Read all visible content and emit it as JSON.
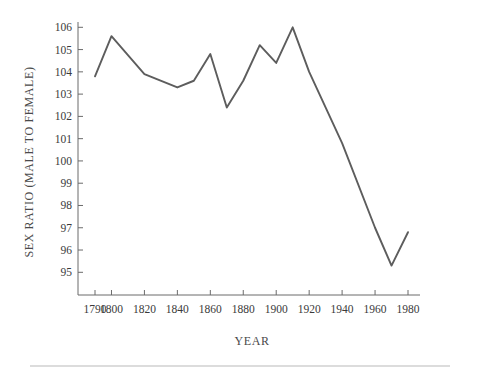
{
  "chart_data": {
    "type": "line",
    "title": "",
    "xlabel": "YEAR",
    "ylabel": "SEX RATIO (MALE TO FEMALE)",
    "xlim": [
      1785,
      1985
    ],
    "ylim": [
      94.4,
      106.4
    ],
    "grid": false,
    "legend": "none",
    "line_color": "#5d5d5d",
    "axis_color": "#6b6b6b",
    "text_color": "#3a3a3a",
    "xticks": [
      1790,
      1800,
      1820,
      1840,
      1860,
      1880,
      1900,
      1920,
      1940,
      1960,
      1980
    ],
    "xtick_labels": [
      "1790",
      "1800",
      "1820",
      "1840",
      "1860",
      "1880",
      "1900",
      "1920",
      "1940",
      "1960",
      "1980"
    ],
    "yticks": [
      95,
      96,
      97,
      98,
      99,
      100,
      101,
      102,
      103,
      104,
      105,
      106
    ],
    "ytick_labels": [
      "95",
      "96",
      "97",
      "98",
      "99",
      "100",
      "101",
      "102",
      "103",
      "104",
      "105",
      "106"
    ],
    "x": [
      1790,
      1800,
      1820,
      1840,
      1850,
      1860,
      1870,
      1880,
      1890,
      1900,
      1910,
      1920,
      1940,
      1960,
      1970,
      1980
    ],
    "values": [
      103.8,
      105.6,
      103.9,
      103.3,
      103.6,
      104.8,
      102.4,
      103.6,
      105.2,
      104.4,
      106.0,
      104.0,
      100.8,
      97.0,
      95.3,
      96.8
    ],
    "series": [
      {
        "name": "Sex ratio (male to female)",
        "values": [
          103.8,
          105.6,
          103.9,
          103.3,
          103.6,
          104.8,
          102.4,
          103.6,
          105.2,
          104.4,
          106.0,
          104.0,
          100.8,
          97.0,
          95.3,
          96.8
        ]
      }
    ]
  }
}
